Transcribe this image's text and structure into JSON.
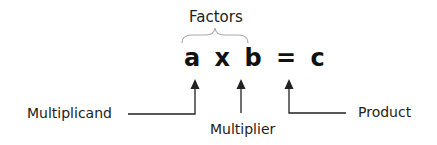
{
  "diagram": {
    "group_label": "Factors",
    "equation": {
      "multiplicand": "a",
      "operator": "x",
      "multiplier": "b",
      "equals": "=",
      "product": "c"
    },
    "labels": {
      "multiplicand": "Multiplicand",
      "multiplier": "Multiplier",
      "product": "Product"
    },
    "colors": {
      "text": "#111111",
      "lines": "#222222",
      "brace": "#aaaaaa"
    }
  }
}
